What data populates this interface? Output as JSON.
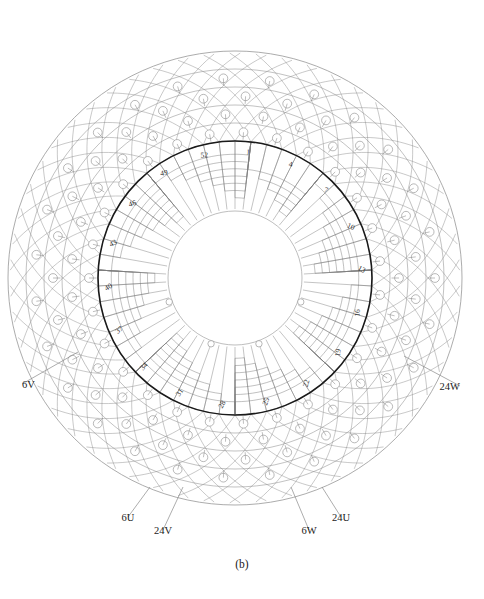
{
  "figure": {
    "caption": "(b)",
    "title": "",
    "type": "winding-layout-diagram"
  },
  "geometry": {
    "center_x": 235,
    "center_y": 278,
    "outer_radius": 227,
    "bore_radius": 137,
    "inner_hole_radius": 67,
    "slot_count": 54,
    "outer_ring_layers": 5
  },
  "colors": {
    "outer_line": "#8a8a8a",
    "inner_line": "#7d7d7d",
    "bore_circle": "#1a1a1a",
    "node_fill": "#ffffff",
    "text": "#1a1a1a",
    "background": "#ffffff"
  },
  "chart_data": {
    "type": "diagram",
    "title": "(b)",
    "slot_numbers": [
      1,
      4,
      7,
      10,
      13,
      16,
      19,
      22,
      25,
      28,
      31,
      34,
      37,
      40,
      43,
      46,
      49,
      52
    ],
    "slot_number_positions_deg": [
      84,
      64,
      44,
      24,
      4,
      344,
      324,
      304,
      284,
      264,
      244,
      224,
      204,
      184,
      164,
      144,
      124,
      104
    ],
    "terminals": [
      {
        "label": "6V",
        "side": "left",
        "x": 22,
        "y": 388,
        "leader_x2": 78,
        "leader_y2": 352
      },
      {
        "label": "24W",
        "side": "right",
        "x": 460,
        "y": 390,
        "leader_x2": 404,
        "leader_y2": 356
      },
      {
        "label": "6U",
        "side": "bottom-left",
        "x": 128,
        "y": 521,
        "leader_x2": 150,
        "leader_y2": 487
      },
      {
        "label": "24V",
        "side": "bottom-left",
        "x": 163,
        "y": 534,
        "leader_x2": 183,
        "leader_y2": 487
      },
      {
        "label": "6W",
        "side": "bottom-right",
        "x": 309,
        "y": 534,
        "leader_x2": 291,
        "leader_y2": 487
      },
      {
        "label": "24U",
        "side": "bottom-right",
        "x": 341,
        "y": 521,
        "leader_x2": 322,
        "leader_y2": 487
      }
    ],
    "xlabel": "",
    "ylabel": "",
    "grid": false,
    "legend": "none"
  }
}
